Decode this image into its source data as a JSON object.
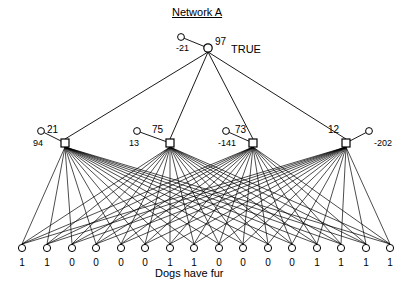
{
  "title": "Network A",
  "caption": "Dogs have fur",
  "output": {
    "label": "TRUE",
    "value": "97",
    "bias": "-21",
    "x": 208,
    "y": 48,
    "bias_x": 181,
    "bias_y": 37
  },
  "hidden_nodes": [
    {
      "value": "21",
      "bias": "-94",
      "bias_display": "94",
      "x": 65,
      "y": 143,
      "bias_x": 41,
      "bias_y": 131,
      "bias_side": "left"
    },
    {
      "value": "75",
      "bias": "13",
      "bias_display": "13",
      "x": 170,
      "y": 143,
      "bias_x": 137,
      "bias_y": 131,
      "bias_side": "left"
    },
    {
      "value": "73",
      "bias": "-141",
      "bias_display": "-141",
      "x": 253,
      "y": 143,
      "bias_x": 226,
      "bias_y": 131,
      "bias_side": "left"
    },
    {
      "value": "12",
      "bias": "-202",
      "bias_display": "-202",
      "x": 346,
      "y": 143,
      "bias_x": 369,
      "bias_y": 131,
      "bias_side": "right"
    }
  ],
  "input_nodes": [
    {
      "value": "1",
      "x": 22
    },
    {
      "value": "1",
      "x": 47
    },
    {
      "value": "0",
      "x": 72
    },
    {
      "value": "0",
      "x": 96
    },
    {
      "value": "0",
      "x": 121
    },
    {
      "value": "0",
      "x": 145
    },
    {
      "value": "1",
      "x": 170
    },
    {
      "value": "1",
      "x": 194
    },
    {
      "value": "0",
      "x": 219
    },
    {
      "value": "0",
      "x": 243
    },
    {
      "value": "0",
      "x": 268
    },
    {
      "value": "0",
      "x": 292
    },
    {
      "value": "1",
      "x": 317
    },
    {
      "value": "1",
      "x": 341
    },
    {
      "value": "1",
      "x": 366
    },
    {
      "value": "1",
      "x": 390
    }
  ],
  "geometry": {
    "input_y": 248,
    "colors": {
      "stroke": "#000000",
      "fill": "#ffffff",
      "background": "#ffffff"
    }
  }
}
